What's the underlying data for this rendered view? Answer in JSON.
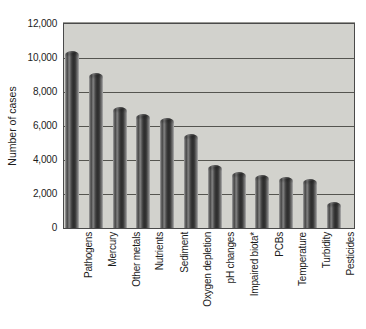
{
  "figure": {
    "ylabel": "Number of cases"
  },
  "chart_data": {
    "type": "bar",
    "title": "",
    "xlabel": "",
    "ylabel": "Number of cases",
    "categories": [
      "Pathogens",
      "Mercury",
      "Other metals",
      "Nutrients",
      "Sediment",
      "Oxygen depletion",
      "pH changes",
      "Impaired biota*",
      "PCBs",
      "Temperature",
      "Turbidity",
      "Pesticides"
    ],
    "values": [
      10400,
      9100,
      7100,
      6700,
      6500,
      5500,
      3700,
      3300,
      3100,
      3000,
      2900,
      1500
    ],
    "ylim": [
      0,
      12000
    ],
    "ytick_interval": 2000,
    "ytick_labels": [
      "0",
      "2,000",
      "4,000",
      "6,000",
      "8,000",
      "10,000",
      "12,000"
    ],
    "grid": true,
    "legend": "none",
    "bar_color": "#3a3a3a",
    "plot_bg": "#d2d2cd",
    "grid_color": "#555550",
    "border_color": "#4a4a4a",
    "text_color": "#1c1c1c",
    "background": "#ffffff"
  }
}
